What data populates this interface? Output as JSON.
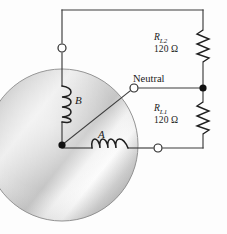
{
  "figure": {
    "background_color": "#fdfdfd",
    "wire_color": "#3c3c3c",
    "core": {
      "name": "transformer-core",
      "center_x": 62,
      "center_y": 145,
      "radius": 76,
      "fill_light": "#fbfbfb",
      "fill_mid": "#d8d8d8",
      "fill_dark": "#a8a8a8",
      "edge_color": "#8c8c8c"
    },
    "coils": [
      {
        "id": "coil-B",
        "label": "B",
        "orientation": "vertical",
        "turns": 4,
        "x": 62,
        "y_start": 86,
        "y_end": 122
      },
      {
        "id": "coil-A",
        "label": "A",
        "orientation": "horizontal",
        "turns": 4,
        "y": 148,
        "x_start": 92,
        "x_end": 128
      }
    ],
    "terminals": [
      {
        "id": "terminal-line2",
        "type": "open",
        "x": 62,
        "y": 48
      },
      {
        "id": "terminal-neutral",
        "type": "open",
        "x": 134,
        "y": 88
      },
      {
        "id": "terminal-line1",
        "type": "open",
        "x": 158,
        "y": 148
      },
      {
        "id": "junction-center",
        "type": "filled",
        "x": 62,
        "y": 145
      },
      {
        "id": "junction-right-rail",
        "type": "filled",
        "x": 203,
        "y": 88
      }
    ],
    "neutral": {
      "label": "Neutral",
      "name": "neutral-conductor"
    },
    "resistors": [
      {
        "id": "resistor-RL2",
        "symbol": "R",
        "subscript": "L2",
        "value": "120 Ω",
        "position": "top",
        "x": 203,
        "y_top": 30,
        "y_bottom": 62
      },
      {
        "id": "resistor-RL1",
        "symbol": "R",
        "subscript": "L1",
        "value": "120 Ω",
        "position": "bottom",
        "x": 203,
        "y_top": 102,
        "y_bottom": 134
      }
    ],
    "wires": [
      {
        "id": "wire-top-horizontal",
        "from": [
          62,
          10
        ],
        "to": [
          203,
          10
        ]
      },
      {
        "id": "wire-left-vertical-upper",
        "from": [
          62,
          10
        ],
        "to": [
          62,
          86
        ]
      },
      {
        "id": "wire-left-vertical-lower",
        "from": [
          62,
          122
        ],
        "to": [
          62,
          145
        ]
      },
      {
        "id": "wire-right-rail-upper",
        "from": [
          203,
          10
        ],
        "to": [
          203,
          30
        ]
      },
      {
        "id": "wire-right-rail-mid",
        "from": [
          203,
          62
        ],
        "to": [
          203,
          102
        ]
      },
      {
        "id": "wire-right-rail-lower",
        "from": [
          203,
          134
        ],
        "to": [
          203,
          148
        ]
      },
      {
        "id": "wire-neutral-diagonal",
        "from": [
          62,
          145
        ],
        "to": [
          134,
          88
        ]
      },
      {
        "id": "wire-neutral-horizontal",
        "from": [
          134,
          88
        ],
        "to": [
          203,
          88
        ]
      },
      {
        "id": "wire-coilA-left",
        "from": [
          62,
          148
        ],
        "to": [
          92,
          148
        ]
      },
      {
        "id": "wire-coilA-right",
        "from": [
          128,
          148
        ],
        "to": [
          203,
          148
        ]
      }
    ]
  }
}
